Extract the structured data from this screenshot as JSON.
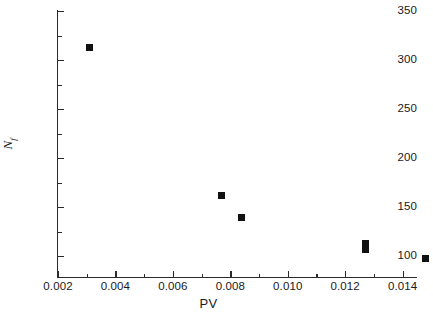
{
  "chart_data": {
    "type": "scatter",
    "title": "",
    "xlabel": "PV",
    "ylabel": "N_f",
    "ylabel_base": "N",
    "ylabel_sub": "f",
    "xlim": [
      0.002,
      0.0145
    ],
    "ylim": [
      100,
      350
    ],
    "xticks": [
      0.002,
      0.004,
      0.006,
      0.008,
      0.01,
      0.012,
      0.014
    ],
    "xticklabels": [
      "0.002",
      "0.004",
      "0.006",
      "0.008",
      "0.010",
      "0.012",
      "0.014"
    ],
    "xminorticks": [
      0.003,
      0.005,
      0.007,
      0.009,
      0.011,
      0.013
    ],
    "yticks": [
      100,
      150,
      200,
      250,
      300,
      350
    ],
    "yticklabels": [
      "100",
      "150",
      "200",
      "250",
      "300",
      "350"
    ],
    "yminorticks": [
      125,
      175,
      225,
      275,
      325
    ],
    "grid": false,
    "legend": false,
    "marker": "filled-square",
    "marker_color": "#111111",
    "axis_color": "#2b2b2b",
    "background": "#ffffff",
    "frame": "left-bottom",
    "points": [
      {
        "x": 0.0031,
        "y": 313
      },
      {
        "x": 0.0077,
        "y": 162
      },
      {
        "x": 0.0084,
        "y": 139
      },
      {
        "x": 0.0127,
        "y": 113
      },
      {
        "x": 0.0127,
        "y": 107
      },
      {
        "x": 0.0148,
        "y": 97
      }
    ]
  }
}
